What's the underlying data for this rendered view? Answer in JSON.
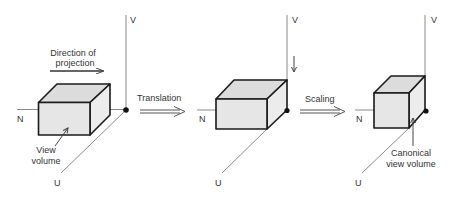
{
  "diagram": {
    "type": "view-volume-normalization",
    "colors": {
      "box_fill": "#e6e6e6",
      "box_edge": "#1a1a1a",
      "axis": "#8a8a8a",
      "text": "#333333"
    },
    "panels": [
      {
        "id": "original",
        "axes": {
          "v": "V",
          "n": "N",
          "u": "U"
        },
        "annotation_top": {
          "line1": "Direction of",
          "line2": "projection"
        },
        "box_label": {
          "line1": "View",
          "line2": "volume"
        }
      },
      {
        "id": "translated",
        "axes": {
          "v": "V",
          "n": "N",
          "u": "U"
        }
      },
      {
        "id": "scaled",
        "axes": {
          "v": "V",
          "n": "N",
          "u": "U"
        },
        "box_label": {
          "line1": "Canonical",
          "line2": "view volume"
        }
      }
    ],
    "transitions": [
      {
        "label": "Translation"
      },
      {
        "label": "Scaling"
      }
    ]
  }
}
